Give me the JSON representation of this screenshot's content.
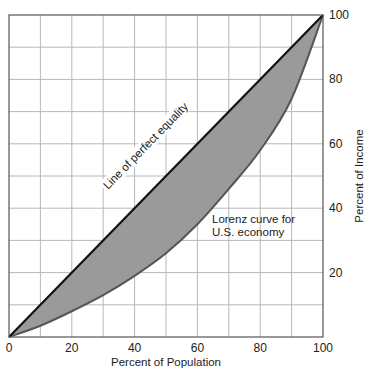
{
  "chart_data": {
    "type": "line",
    "title": "",
    "xlabel": "Percent of Population",
    "ylabel": "Percent of Income",
    "xlim": [
      0,
      100
    ],
    "ylim": [
      0,
      100
    ],
    "grid": true,
    "grid_step": 10,
    "x_ticks": [
      0,
      20,
      40,
      60,
      80,
      100
    ],
    "y_ticks": [
      20,
      40,
      60,
      80,
      100
    ],
    "y_axis_position": "right",
    "legend": null,
    "x": [
      0,
      10,
      20,
      30,
      40,
      50,
      60,
      70,
      80,
      90,
      100
    ],
    "series": [
      {
        "name": "Line of perfect equality",
        "values": [
          0,
          10,
          20,
          30,
          40,
          50,
          60,
          70,
          80,
          90,
          100
        ],
        "color": "#111111"
      },
      {
        "name": "Lorenz curve for U.S. economy",
        "values": [
          0,
          3.5,
          8,
          13,
          19,
          26,
          35,
          46,
          58,
          74,
          100
        ],
        "color": "#555555"
      }
    ],
    "shaded_area": {
      "between": [
        "Line of perfect equality",
        "Lorenz curve for U.S. economy"
      ],
      "color": "#9a9a9a"
    },
    "annotations": [
      {
        "text": "Line of perfect equality",
        "position": "along diagonal, ~x 30-55",
        "rotation": -45
      },
      {
        "text_lines": [
          "Lorenz curve for",
          "U.S. economy"
        ],
        "position": "x ~64, y ~42"
      }
    ]
  },
  "labels": {
    "xlabel": "Percent of Population",
    "ylabel": "Percent of Income",
    "equality": "Line of perfect equality",
    "lorenz_line1": "Lorenz curve for",
    "lorenz_line2": "U.S. economy"
  },
  "ticks": {
    "x": [
      "0",
      "20",
      "40",
      "60",
      "80",
      "100"
    ],
    "y": [
      "20",
      "40",
      "60",
      "80",
      "100"
    ]
  },
  "colors": {
    "fill": "#9a9a9a",
    "grid": "#b8b8b8",
    "frame": "#555555",
    "equality": "#111111",
    "lorenz": "#555555"
  }
}
